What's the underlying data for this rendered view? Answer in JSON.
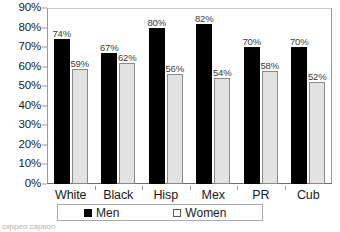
{
  "chart_data": {
    "type": "bar",
    "title": "",
    "subtitle": "",
    "xlabel": "",
    "ylabel": "",
    "categories": [
      "White",
      "Black",
      "Hisp",
      "Mex",
      "PR",
      "Cub"
    ],
    "series": [
      {
        "name": "Men",
        "color": "#000000",
        "values": [
          74,
          67,
          80,
          82,
          70,
          70
        ],
        "labels": [
          "74%",
          "67%",
          "80%",
          "82%",
          "70%",
          "70%"
        ]
      },
      {
        "name": "Women",
        "color": "#e2e2e2",
        "values": [
          59,
          62,
          56,
          54,
          58,
          52
        ],
        "labels": [
          "59%",
          "62%",
          "56%",
          "54%",
          "58%",
          "52%"
        ]
      }
    ],
    "ylim": [
      0,
      90
    ],
    "ytick_step": 10,
    "ytick_labels": [
      "90%",
      "80%",
      "70%",
      "60%",
      "50%",
      "40%",
      "30%",
      "20%",
      "10%",
      "0%"
    ],
    "ytick_values": [
      90,
      80,
      70,
      60,
      50,
      40,
      30,
      20,
      10,
      0
    ],
    "grid": false,
    "legend_position": "bottom",
    "value_labels_shown": true
  },
  "legend": {
    "entries": [
      {
        "label": "Men",
        "swatch": "filled-black-square"
      },
      {
        "label": "Women",
        "swatch": "hollow-square"
      }
    ]
  },
  "caption": {
    "text": "clipped caption"
  }
}
